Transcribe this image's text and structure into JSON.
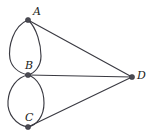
{
  "figure": {
    "background_color": "#ffffff",
    "stroke_color": "#3a3a42",
    "vertex_color": "#4a4a52",
    "label_color": "#1b1b20",
    "vertices": [
      {
        "id": "A",
        "label": "A",
        "x": 28,
        "y": 20,
        "label_x": 33,
        "label_y": 6
      },
      {
        "id": "B",
        "label": "B",
        "x": 28,
        "y": 75,
        "label_x": 25,
        "label_y": 60
      },
      {
        "id": "C",
        "label": "C",
        "x": 28,
        "y": 127,
        "label_x": 25,
        "label_y": 112
      },
      {
        "id": "D",
        "label": "D",
        "x": 132,
        "y": 77,
        "label_x": 137,
        "label_y": 70
      }
    ],
    "edges": [
      {
        "id": "A-B-left",
        "from": "A",
        "to": "B",
        "kind": "curve"
      },
      {
        "id": "A-B-right",
        "from": "A",
        "to": "B",
        "kind": "curve"
      },
      {
        "id": "B-C-left",
        "from": "B",
        "to": "C",
        "kind": "curve"
      },
      {
        "id": "B-C-right",
        "from": "B",
        "to": "C",
        "kind": "curve"
      },
      {
        "id": "A-D",
        "from": "A",
        "to": "D",
        "kind": "line"
      },
      {
        "id": "B-D",
        "from": "B",
        "to": "D",
        "kind": "line"
      },
      {
        "id": "C-D",
        "from": "C",
        "to": "D",
        "kind": "line"
      }
    ],
    "paths": {
      "arc_ab_left": "M 28 20 C 13 26 8 47 10 59 C 12 68 20 73 28 75",
      "arc_ab_right": "M 28 20 C 37 28 41 45 41 56 C 41 66 35 73 28 75",
      "arc_bc_left": "M 28 75 C 17 77 9 88 8 101 C 7 114 16 125 28 127",
      "arc_bc_right": "M 28 75 C 38 78 44 90 44 103 C 44 116 37 125 28 127",
      "line_ad": "M 28 20 L 132 77",
      "line_bd": "M 28 75 L 132 77",
      "line_cd": "M 28 127 L 132 77"
    },
    "vertex_radius": 2.6
  }
}
